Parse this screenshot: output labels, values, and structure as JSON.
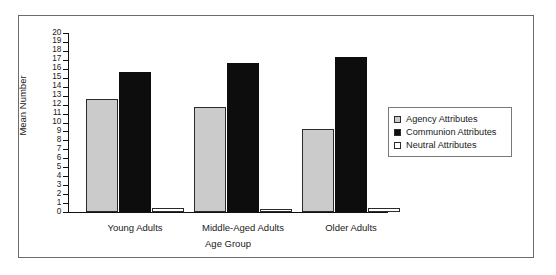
{
  "chart_data": {
    "type": "bar",
    "title": "",
    "xlabel": "Age Group",
    "ylabel": "Mean Number",
    "ylim": [
      0,
      20
    ],
    "ytick_step": 1,
    "grid": false,
    "legend_position": "right",
    "categories": [
      "Young Adults",
      "Middle-Aged Adults",
      "Older Adults"
    ],
    "series": [
      {
        "name": "Agency Attributes",
        "color": "#cbcbcb",
        "values": [
          12.6,
          11.7,
          9.3
        ]
      },
      {
        "name": "Communion Attributes",
        "color": "#0d0d0d",
        "values": [
          15.6,
          16.7,
          17.3
        ]
      },
      {
        "name": "Neutral Attributes",
        "color": "#ffffff",
        "values": [
          0.4,
          0.3,
          0.4
        ]
      }
    ],
    "ytick_labels": [
      "20",
      "19",
      "18",
      "17",
      "16",
      "15",
      "14",
      "13",
      "12",
      "11",
      "10",
      "9",
      "8",
      "7",
      "6",
      "5",
      "4",
      "3",
      "2",
      "1",
      "0"
    ]
  },
  "axes": {
    "y_title": "Mean Number",
    "x_title": "Age Group"
  },
  "legend": {
    "entries": [
      {
        "label": "Agency Attributes",
        "swatch": "#cbcbcb"
      },
      {
        "label": "Communion Attributes",
        "swatch": "#0d0d0d"
      },
      {
        "label": "Neutral Attributes",
        "swatch": "#ffffff"
      }
    ]
  },
  "colors": {
    "frame": "#6b6b6b",
    "axis": "#111111",
    "text": "#1a1a1a",
    "bar_outline": "#2b2b2b",
    "background": "#ffffff"
  }
}
